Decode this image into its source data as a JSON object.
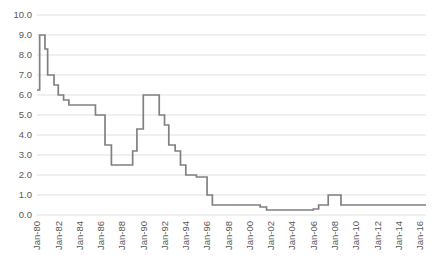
{
  "chart_data": {
    "type": "line",
    "title": "",
    "subtitle": "",
    "xlabel": "",
    "ylabel": "",
    "grid": "horizontal",
    "legend": "none",
    "line_color": "#808080",
    "grid_color": "#d9d9d9",
    "tick_label_color": "#595959",
    "background": "#ffffff",
    "ylim": [
      0.0,
      10.0
    ],
    "ytick_step": 1.0,
    "ytick_labels": [
      "0.0",
      "1.0",
      "2.0",
      "3.0",
      "4.0",
      "5.0",
      "6.0",
      "7.0",
      "8.0",
      "9.0",
      "10.0"
    ],
    "ytick_values": [
      0.0,
      1.0,
      2.0,
      3.0,
      4.0,
      5.0,
      6.0,
      7.0,
      8.0,
      9.0,
      10.0
    ],
    "xtick_labels": [
      "Jan-80",
      "Jan-82",
      "Jan-84",
      "Jan-86",
      "Jan-88",
      "Jan-90",
      "Jan-92",
      "Jan-94",
      "Jan-96",
      "Jan-98",
      "Jan-00",
      "Jan-02",
      "Jan-04",
      "Jan-06",
      "Jan-08",
      "Jan-10",
      "Jan-12",
      "Jan-14",
      "Jan-16"
    ],
    "xtick_values": [
      1980,
      1982,
      1984,
      1986,
      1988,
      1990,
      1992,
      1994,
      1996,
      1998,
      2000,
      2002,
      2004,
      2006,
      2008,
      2010,
      2012,
      2014,
      2016
    ],
    "xlim": [
      1980.0,
      2016.6
    ],
    "series": [
      {
        "name": "Rate",
        "step": "post",
        "x": [
          1980.0,
          1980.25,
          1980.5,
          1980.75,
          1981.0,
          1981.25,
          1981.6,
          1982.0,
          1982.5,
          1983.0,
          1983.5,
          1984.0,
          1984.5,
          1985.0,
          1985.5,
          1986.0,
          1986.4,
          1986.8,
          1987.0,
          1987.5,
          1988.0,
          1988.5,
          1989.0,
          1989.4,
          1989.8,
          1990.0,
          1990.4,
          1990.8,
          1991.0,
          1991.5,
          1992.0,
          1992.4,
          1992.8,
          1993.0,
          1993.5,
          1994.0,
          1994.5,
          1995.0,
          1995.5,
          1996.0,
          1996.5,
          1997.0,
          1998.0,
          1999.0,
          2000.0,
          2000.6,
          2001.0,
          2001.6,
          2002.0,
          2003.0,
          2004.0,
          2005.0,
          2006.0,
          2006.5,
          2007.0,
          2007.4,
          2008.0,
          2008.6,
          2009.0,
          2010.0,
          2011.0,
          2012.0,
          2013.0,
          2014.0,
          2015.0,
          2016.0,
          2016.6
        ],
        "values": [
          6.25,
          9.0,
          9.0,
          8.3,
          7.0,
          7.0,
          6.5,
          6.0,
          5.75,
          5.5,
          5.5,
          5.5,
          5.5,
          5.5,
          5.0,
          5.0,
          3.5,
          3.5,
          2.5,
          2.5,
          2.5,
          2.5,
          3.2,
          4.3,
          4.3,
          6.0,
          6.0,
          6.0,
          6.0,
          5.0,
          4.5,
          3.5,
          3.5,
          3.2,
          2.5,
          2.0,
          2.0,
          1.9,
          1.9,
          1.0,
          0.5,
          0.5,
          0.5,
          0.5,
          0.5,
          0.5,
          0.4,
          0.25,
          0.25,
          0.25,
          0.25,
          0.25,
          0.3,
          0.5,
          0.5,
          1.0,
          1.0,
          0.5,
          0.5,
          0.5,
          0.5,
          0.5,
          0.5,
          0.5,
          0.5,
          0.5,
          0.5
        ]
      }
    ],
    "annotations": []
  },
  "plot_geometry": {
    "left": 37,
    "right": 426,
    "top": 15,
    "bottom": 215
  }
}
